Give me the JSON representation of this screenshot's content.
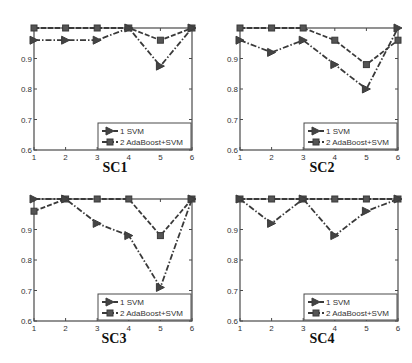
{
  "chart_data": [
    {
      "type": "line",
      "title": "SC1",
      "x": [
        1,
        2,
        3,
        4,
        5,
        6
      ],
      "ylim": [
        0.6,
        1.0
      ],
      "xlim": [
        1,
        6
      ],
      "yticks": [
        "0.6",
        "0.7",
        "0.8",
        "0.9"
      ],
      "xticks": [
        "1",
        "2",
        "3",
        "4",
        "5",
        "6"
      ],
      "legend_position": "lower right",
      "series": [
        {
          "name": "1 SVM",
          "marker": "triangle-right",
          "linestyle": "dash-dot",
          "values": [
            0.96,
            0.96,
            0.96,
            1.0,
            0.875,
            1.0
          ]
        },
        {
          "name": "2 AdaBoost+SVM",
          "marker": "square",
          "linestyle": "dashed",
          "values": [
            1.0,
            1.0,
            1.0,
            1.0,
            0.96,
            1.0
          ]
        }
      ]
    },
    {
      "type": "line",
      "title": "SC2",
      "x": [
        1,
        2,
        3,
        4,
        5,
        6
      ],
      "ylim": [
        0.6,
        1.0
      ],
      "xlim": [
        1,
        6
      ],
      "yticks": [
        "0.6",
        "0.7",
        "0.8",
        "0.9"
      ],
      "xticks": [
        "1",
        "2",
        "3",
        "4",
        "5",
        "6"
      ],
      "legend_position": "lower right",
      "series": [
        {
          "name": "1 SVM",
          "marker": "triangle-right",
          "linestyle": "dash-dot",
          "values": [
            0.96,
            0.92,
            0.96,
            0.88,
            0.8,
            1.0
          ]
        },
        {
          "name": "2 AdaBoost+SVM",
          "marker": "square",
          "linestyle": "dashed",
          "values": [
            1.0,
            1.0,
            1.0,
            0.96,
            0.88,
            0.96
          ]
        }
      ]
    },
    {
      "type": "line",
      "title": "SC3",
      "x": [
        1,
        2,
        3,
        4,
        5,
        6
      ],
      "ylim": [
        0.6,
        1.0
      ],
      "xlim": [
        1,
        6
      ],
      "yticks": [
        "0.6",
        "0.7",
        "0.8",
        "0.9"
      ],
      "xticks": [
        "1",
        "2",
        "3",
        "4",
        "5",
        "6"
      ],
      "legend_position": "lower right",
      "series": [
        {
          "name": "1 SVM",
          "marker": "triangle-right",
          "linestyle": "dash-dot",
          "values": [
            1.0,
            1.0,
            0.92,
            0.88,
            0.71,
            1.0
          ]
        },
        {
          "name": "2 AdaBoost+SVM",
          "marker": "square",
          "linestyle": "dashed",
          "values": [
            0.96,
            1.0,
            1.0,
            1.0,
            0.88,
            1.0
          ]
        }
      ]
    },
    {
      "type": "line",
      "title": "SC4",
      "x": [
        1,
        2,
        3,
        4,
        5,
        6
      ],
      "ylim": [
        0.6,
        1.0
      ],
      "xlim": [
        1,
        6
      ],
      "yticks": [
        "0.6",
        "0.7",
        "0.8",
        "0.9"
      ],
      "xticks": [
        "1",
        "2",
        "3",
        "4",
        "5",
        "6"
      ],
      "legend_position": "lower right",
      "series": [
        {
          "name": "1 SVM",
          "marker": "triangle-right",
          "linestyle": "dash-dot",
          "values": [
            1.0,
            0.92,
            1.0,
            0.88,
            0.96,
            1.0
          ]
        },
        {
          "name": "2 AdaBoost+SVM",
          "marker": "square",
          "linestyle": "dashed",
          "values": [
            1.0,
            1.0,
            1.0,
            1.0,
            1.0,
            1.0
          ]
        }
      ]
    }
  ],
  "captions": [
    "SC1",
    "SC2",
    "SC3",
    "SC4"
  ],
  "colors": {
    "line": "#3a3a3a",
    "axis": "#4a4a4a",
    "text": "#333333"
  }
}
